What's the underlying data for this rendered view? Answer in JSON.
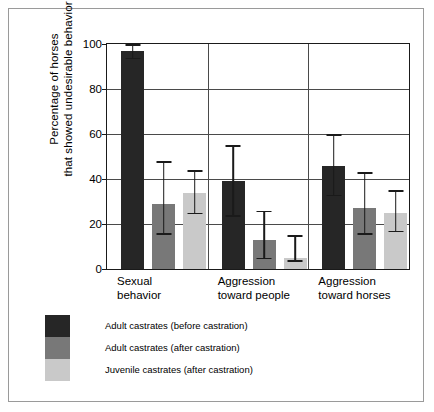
{
  "chart_data": {
    "type": "bar",
    "title": "",
    "xlabel": "",
    "ylabel": "Percentage of horses that showed undesirable behavior",
    "ylabel_line1": "Percentage of horses",
    "ylabel_line2": "that showed undesirable behavior",
    "ylim": [
      0,
      100
    ],
    "yticks": [
      0,
      20,
      40,
      60,
      80,
      100
    ],
    "ytick_labels": [
      "0",
      "20",
      "40",
      "60",
      "80",
      "100"
    ],
    "grid": true,
    "legend_position": "below-left",
    "categories": [
      "Sexual behavior",
      "Aggression toward people",
      "Aggression toward horses"
    ],
    "category_lines": [
      [
        "Sexual",
        "behavior"
      ],
      [
        "Aggression",
        "toward people"
      ],
      [
        "Aggression",
        "toward horses"
      ]
    ],
    "series": [
      {
        "name": "Adult castrates (before castration)",
        "color": "#262626",
        "values": [
          97,
          39,
          46
        ],
        "err_low": [
          94,
          24,
          33
        ],
        "err_high": [
          100,
          55,
          60
        ]
      },
      {
        "name": "Adult castrates (after castration)",
        "color": "#787878",
        "values": [
          29,
          13,
          27
        ],
        "err_low": [
          16,
          5,
          16
        ],
        "err_high": [
          48,
          26,
          43
        ]
      },
      {
        "name": "Juvenile castrates (after castration)",
        "color": "#c9c9c9",
        "values": [
          34,
          5,
          25
        ],
        "err_low": [
          25,
          4,
          17
        ],
        "err_high": [
          44,
          15,
          35
        ]
      }
    ]
  },
  "legend": {
    "items": [
      {
        "label": "Adult castrates (before castration)",
        "color": "#262626"
      },
      {
        "label": "Adult castrates (after castration)",
        "color": "#787878"
      },
      {
        "label": "Juvenile castrates (after castration)",
        "color": "#c9c9c9"
      }
    ]
  },
  "axis": {
    "y_title_line1": "Percentage of horses",
    "y_title_line2": "that showed undesirable behavior",
    "tick_0": "0",
    "tick_20": "20",
    "tick_40": "40",
    "tick_60": "60",
    "tick_80": "80",
    "tick_100": "100"
  },
  "xlabels": {
    "g0_l1": "Sexual",
    "g0_l2": "behavior",
    "g1_l1": "Aggression",
    "g1_l2": "toward people",
    "g2_l1": "Aggression",
    "g2_l2": "toward horses"
  }
}
